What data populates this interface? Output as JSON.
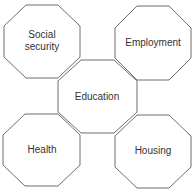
{
  "diagram": {
    "nodes": [
      {
        "id": "social-security",
        "label_lines": [
          "Social",
          "security"
        ],
        "cx": 42,
        "cy": 41,
        "w": 76,
        "h": 73
      },
      {
        "id": "employment",
        "label_lines": [
          "Employment"
        ],
        "cx": 153,
        "cy": 43,
        "w": 76,
        "h": 74
      },
      {
        "id": "education",
        "label_lines": [
          "Education"
        ],
        "cx": 97,
        "cy": 96,
        "w": 79,
        "h": 73
      },
      {
        "id": "health",
        "label_lines": [
          "Health"
        ],
        "cx": 42,
        "cy": 150,
        "w": 77,
        "h": 72
      },
      {
        "id": "housing",
        "label_lines": [
          "Housing"
        ],
        "cx": 153,
        "cy": 151,
        "w": 76,
        "h": 73
      }
    ],
    "colors": {
      "stroke": "#6e6e6e",
      "text": "#333333",
      "fill": "#ffffff"
    }
  }
}
